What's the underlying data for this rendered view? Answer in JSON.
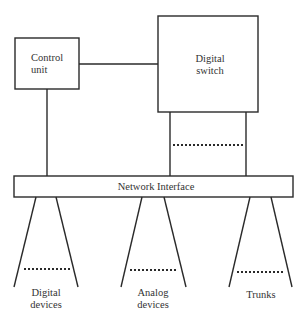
{
  "diagram": {
    "nodes": {
      "control_unit": {
        "line1": "Control",
        "line2": "unit"
      },
      "digital_switch": {
        "line1": "Digital",
        "line2": "switch"
      },
      "network_interface": {
        "label": "Network Interface"
      }
    },
    "endpoints": [
      {
        "line1": "Digital",
        "line2": "devices"
      },
      {
        "line1": "Analog",
        "line2": "devices"
      },
      {
        "line1": "Trunks",
        "line2": ""
      }
    ],
    "edges": [
      {
        "from": "Control unit",
        "to": "Digital switch"
      },
      {
        "from": "Control unit",
        "to": "Network Interface"
      },
      {
        "from": "Digital switch",
        "to": "Network Interface",
        "multiple": true
      },
      {
        "from": "Network Interface",
        "to": "Digital devices",
        "multiple": true
      },
      {
        "from": "Network Interface",
        "to": "Analog devices",
        "multiple": true
      },
      {
        "from": "Network Interface",
        "to": "Trunks",
        "multiple": true
      }
    ]
  }
}
